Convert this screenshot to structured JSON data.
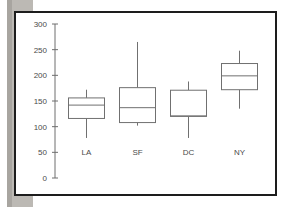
{
  "figure": {
    "background_color": "#ffffff",
    "frame_color": "#1d1d1d",
    "scan_band_color": "#bcb9b4"
  },
  "chart_data": {
    "type": "box",
    "title": "",
    "xlabel": "",
    "ylabel": "",
    "categories": [
      "LA",
      "SF",
      "DC",
      "NY"
    ],
    "ylim": [
      0,
      300
    ],
    "yticks": [
      0,
      50,
      100,
      150,
      200,
      250,
      300
    ],
    "ytick_labels": [
      "0",
      "50",
      "100",
      "150",
      "200",
      "250",
      "300"
    ],
    "grid": false,
    "legend": null,
    "boxes": [
      {
        "category": "LA",
        "whisker_low": 78,
        "q1": 116,
        "median": 142,
        "q3": 156,
        "whisker_high": 172
      },
      {
        "category": "SF",
        "whisker_low": 102,
        "q1": 108,
        "median": 137,
        "q3": 176,
        "whisker_high": 265
      },
      {
        "category": "DC",
        "whisker_low": 78,
        "q1": 120,
        "median": 121,
        "q3": 171,
        "whisker_high": 188
      },
      {
        "category": "NY",
        "whisker_low": 135,
        "q1": 172,
        "median": 199,
        "q3": 223,
        "whisker_high": 248
      }
    ],
    "line_color": "#707070",
    "axis_color": "#6e6e6e",
    "box_fill": "#ffffff"
  }
}
